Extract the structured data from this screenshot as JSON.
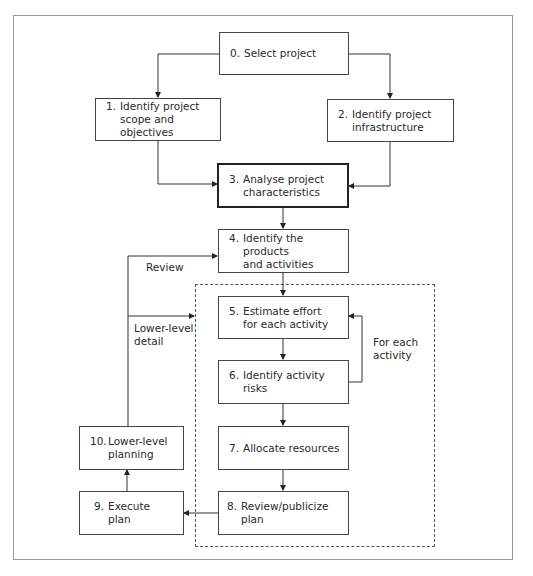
{
  "diagram": {
    "boxes": [
      {
        "id": "0",
        "number": "0.",
        "text": "Select project"
      },
      {
        "id": "1",
        "number": "1.",
        "text": "Identify project\nscope and objectives"
      },
      {
        "id": "2",
        "number": "2.",
        "text": "Identify project\ninfrastructure"
      },
      {
        "id": "3",
        "number": "3.",
        "text": "Analyse project\ncharacteristics",
        "emphasis": "thick-border"
      },
      {
        "id": "4",
        "number": "4.",
        "text": "Identify the products\nand activities"
      },
      {
        "id": "5",
        "number": "5.",
        "text": "Estimate effort\nfor each activity"
      },
      {
        "id": "6",
        "number": "6.",
        "text": "Identify activity\nrisks"
      },
      {
        "id": "7",
        "number": "7.",
        "text": "Allocate resources"
      },
      {
        "id": "8",
        "number": "8.",
        "text": "Review/publicize plan"
      },
      {
        "id": "9",
        "number": "9.",
        "text": "Execute plan"
      },
      {
        "id": "10",
        "number": "10.",
        "text": "Lower-level\nplanning"
      }
    ],
    "edge_labels": {
      "review": "Review",
      "lower_level_detail": "Lower-level\ndetail",
      "for_each_activity": "For each\nactivity"
    },
    "edges": [
      {
        "from": "0",
        "to": "1"
      },
      {
        "from": "0",
        "to": "2"
      },
      {
        "from": "1",
        "to": "3"
      },
      {
        "from": "2",
        "to": "3"
      },
      {
        "from": "3",
        "to": "4"
      },
      {
        "from": "4",
        "to": "5"
      },
      {
        "from": "5",
        "to": "6"
      },
      {
        "from": "6",
        "to": "5",
        "label": "For each activity"
      },
      {
        "from": "6",
        "to": "7"
      },
      {
        "from": "7",
        "to": "8"
      },
      {
        "from": "8",
        "to": "9"
      },
      {
        "from": "9",
        "to": "10"
      },
      {
        "from": "10",
        "to": "4",
        "label": "Review"
      },
      {
        "from": "10",
        "to": "dashed-group",
        "label": "Lower-level detail"
      }
    ],
    "colors": {
      "line": "#333333",
      "frame": "#9a9a9a",
      "background": "#ffffff"
    }
  }
}
